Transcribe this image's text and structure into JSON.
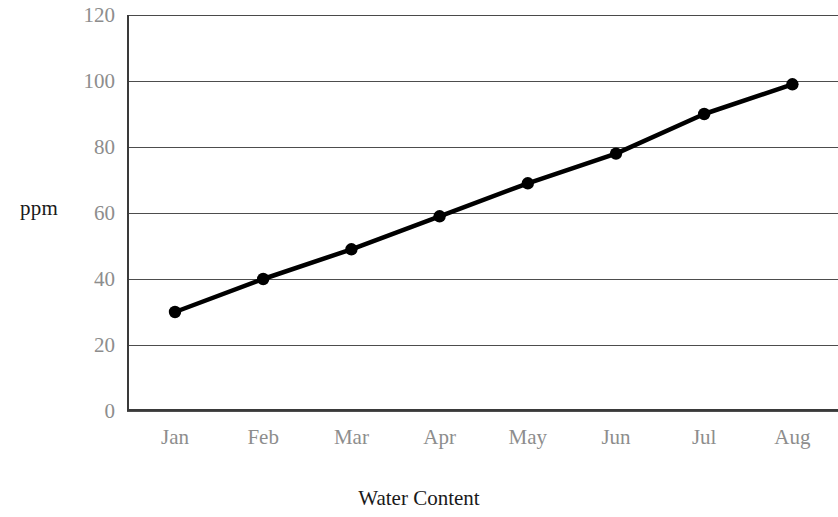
{
  "chart_data": {
    "type": "line",
    "title": "",
    "xlabel": "Water Content",
    "ylabel": "ppm",
    "categories": [
      "Jan",
      "Feb",
      "Mar",
      "Apr",
      "May",
      "Jun",
      "Jul",
      "Aug"
    ],
    "values": [
      30,
      40,
      49,
      59,
      69,
      78,
      90,
      99
    ],
    "series": [
      {
        "name": "ppm",
        "values": [
          30,
          40,
          49,
          59,
          69,
          78,
          90,
          99
        ]
      }
    ],
    "ylim": [
      0,
      120
    ],
    "yticks": [
      0,
      20,
      40,
      60,
      80,
      100,
      120
    ],
    "ytick_labels": [
      "0",
      "20",
      "40",
      "60",
      "80",
      "100",
      "120"
    ],
    "xtick_labels": [
      "Jan",
      "Feb",
      "Mar",
      "Apr",
      "May",
      "Jun",
      "Jul",
      "Aug"
    ],
    "grid": true,
    "grid_axis": "y",
    "legend": false,
    "legend_position": "none",
    "marker": "circle",
    "line_color": "#000000",
    "marker_color": "#000000",
    "grid_color": "#4d4d4d",
    "tick_label_color": "#8d8d8d",
    "axis_label_color": "#1a1a1a",
    "background_color": "#ffffff"
  }
}
